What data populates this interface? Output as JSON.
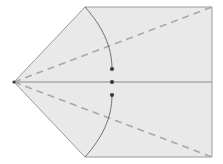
{
  "figure": {
    "width": 223,
    "height": 164,
    "background_color": "#ffffff",
    "fill_color": "#e9e9e9",
    "outline_color": "#9a9a9a",
    "dashed_color": "#a8a8a8",
    "arc_color": "#707070",
    "axis_color": "#8a8a8a",
    "dot_color": "#3a3a3a"
  },
  "geometry": {
    "apex": {
      "x": 14,
      "y": 82,
      "label": "left-apex"
    },
    "rect_left": 85,
    "rect_right": 212,
    "rect_top": 7,
    "rect_bottom": 157,
    "axis_y": 82,
    "shape_points": "14,82 85,7 212,7 212,157 85,157",
    "dots": [
      {
        "x": 112,
        "y": 69,
        "name": "upper-dot"
      },
      {
        "x": 112,
        "y": 82,
        "name": "center-dot"
      },
      {
        "x": 112,
        "y": 95,
        "name": "lower-dot"
      }
    ],
    "dashed_lines": [
      {
        "name": "upper-diagonal",
        "x1": 14,
        "y1": 82,
        "x2": 212,
        "y2": 7
      },
      {
        "name": "lower-diagonal",
        "x1": 14,
        "y1": 82,
        "x2": 212,
        "y2": 157
      }
    ],
    "axis_line": {
      "name": "horizontal-axis",
      "x1": 14,
      "y1": 82,
      "x2": 212,
      "y2": 82
    },
    "arcs": [
      {
        "name": "upper-arc",
        "path": "M 85 7 C 102 26 112 46 112 69"
      },
      {
        "name": "lower-arc",
        "path": "M 85 157 C 102 138 112 118 112 95"
      }
    ],
    "dash_pattern": "7 5",
    "dot_radius": 2.1,
    "line_width": 1
  },
  "labels": {
    "figure_caption": "",
    "annotations": []
  }
}
